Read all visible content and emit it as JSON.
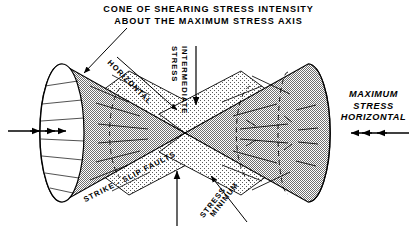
{
  "figure": {
    "type": "geologic-stress-diagram",
    "background_color": "#ffffff",
    "ink_color": "#000000",
    "cone_fill_color": "#a8a8a8",
    "fault_plane_fill_color": "#e2e2e2",
    "title": {
      "line_1": "CONE OF SHEARING STRESS INTENSITY",
      "line_2": "ABOUT THE MAXIMUM STRESS AXIS"
    },
    "labels": {
      "horizontal": "HORIZONTAL",
      "intermediate": "INTERMEDIATE",
      "intermediate_stress": "STRESS",
      "strike_slip_faults": "STRIKE - SLIP FAULTS",
      "minimum": "MINIMUM",
      "minimum_stress": "STRESS",
      "maximum_stress_horizontal": "MAXIMUM\nSTRESS\nHORIZONTAL",
      "maximum_line_1": "MAXIMUM",
      "maximum_line_2": "STRESS",
      "maximum_line_3": "HORIZONTAL"
    },
    "arrows": {
      "left_compression": "three right-pointing arrowheads on horizontal axis at left",
      "right_compression": "three left-pointing arrowheads on horizontal axis at right",
      "intermediate_down": "downward arrow from top center",
      "minimum_up_center": "upward arrow from bottom center",
      "minimum_up_diagonal": "upward-left diagonal arrow from lower right",
      "horizontal_diagonal": "down-right diagonal arrow from HORIZONTAL label",
      "title_leader": "leader line from title to left cone surface"
    },
    "elements": {
      "left_cone": "left double cone half, elliptical open base at far left, apex at center",
      "right_cone": "right double cone half, apex at center, elliptical base at far right",
      "fault_plane_upper_left": "stippled wedge plane upper-left quadrant",
      "fault_plane_upper_right": "stippled wedge plane upper-right quadrant",
      "fault_plane_lower_left": "stippled wedge plane lower-left quadrant",
      "fault_plane_lower_right": "stippled wedge plane lower-right quadrant",
      "apex": "common apex of both cones at diagram center"
    }
  }
}
